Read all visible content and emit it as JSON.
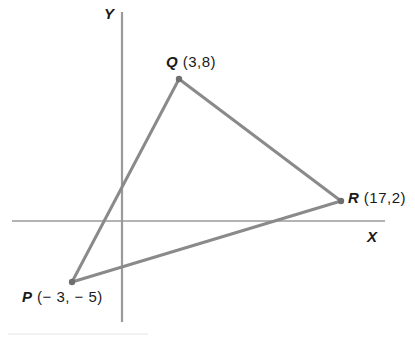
{
  "figure": {
    "background_color": "#ffffff",
    "axis_color": "#9a9a9a",
    "line_color": "#8a8a8a",
    "text_color": "#1a1a1a"
  },
  "axes": {
    "x_label": "X",
    "y_label": "Y",
    "origin_px": {
      "x": 122,
      "y": 221
    },
    "x_axis_px": {
      "x1": 12,
      "y1": 221,
      "x2": 385,
      "y2": 221
    },
    "y_axis_px": {
      "x1": 122,
      "y1": 12,
      "x2": 122,
      "y2": 322
    }
  },
  "vertices": [
    {
      "id": "Q",
      "name": "Q",
      "coords_text": "(3,8)",
      "x": 3,
      "y": 8,
      "px": {
        "x": 179,
        "y": 79
      }
    },
    {
      "id": "R",
      "name": "R",
      "coords_text": "(17,2)",
      "x": 17,
      "y": 2,
      "px": {
        "x": 341,
        "y": 201
      }
    },
    {
      "id": "P",
      "name": "P",
      "coords_text": "(− 3, − 5)",
      "x": -3,
      "y": -5,
      "px": {
        "x": 72,
        "y": 282
      }
    }
  ],
  "edges": [
    {
      "id": "PQ",
      "from": "P",
      "to": "Q"
    },
    {
      "id": "QR",
      "from": "Q",
      "to": "R"
    },
    {
      "id": "RP",
      "from": "R",
      "to": "P"
    }
  ],
  "chart_data": {
    "type": "scatter",
    "xlabel": "X",
    "ylabel": "Y",
    "grid": false,
    "legend": "none",
    "points": [
      {
        "label": "P",
        "x": -3,
        "y": -5
      },
      {
        "label": "Q",
        "x": 3,
        "y": 8
      },
      {
        "label": "R",
        "x": 17,
        "y": 2
      }
    ],
    "annotations": [
      "P ( − 3, − 5)",
      "Q (3,8)",
      "R (17,2)"
    ]
  }
}
